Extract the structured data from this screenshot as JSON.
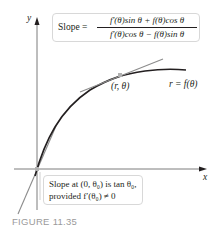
{
  "figure": {
    "caption": "FIGURE 11.35",
    "axes": {
      "x_label": "x",
      "y_label": "y"
    },
    "curve_label": "r = f(θ)",
    "point_label": "(r, θ)",
    "slope_formula": {
      "prefix": "Slope =",
      "numerator": "f′(θ)sin θ + f(θ)cos θ",
      "denominator": "f′(θ)cos θ − f(θ)sin θ"
    },
    "origin_note": {
      "line1": "Slope at (0, θ₀) is tan θ₀,",
      "line2": "provided f′(θ₀) ≠ 0"
    },
    "colors": {
      "curve": "#231f20",
      "tangent": "#8c8c8c",
      "point": "#b0b0b0",
      "caption": "#9a9a9a",
      "box_border": "#d8d8d8"
    }
  }
}
